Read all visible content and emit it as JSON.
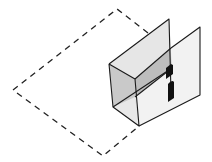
{
  "diagram": {
    "type": "isometric-illustration",
    "colors": {
      "background": "#ffffff",
      "stroke": "#1a1a1a",
      "dashed_outline": "#222222",
      "back_panel_fill": "#dcdcdc",
      "left_face_fill": "#c9c9c9",
      "top_face_fill": "#e2e2e2",
      "inner_shade_fill": "#bdbdbd",
      "front_panel_fill": "#f2f2f2",
      "slot_fill": "#111111"
    },
    "elements": [
      {
        "name": "dashed-floor-outline",
        "style": "dashed"
      },
      {
        "name": "back-panel",
        "style": "solid"
      },
      {
        "name": "box-left-face",
        "style": "solid"
      },
      {
        "name": "box-top-face",
        "style": "solid"
      },
      {
        "name": "front-panel",
        "style": "solid"
      },
      {
        "name": "upper-slot",
        "style": "filled"
      },
      {
        "name": "lower-slot",
        "style": "filled"
      }
    ]
  }
}
